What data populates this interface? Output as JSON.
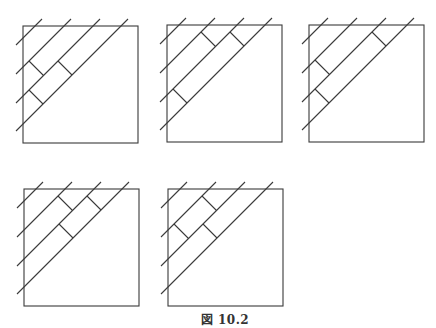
{
  "caption": "図 10.2",
  "style": {
    "stroke": "#3a3a3a",
    "background": "#ffffff"
  },
  "square": {
    "width": 115,
    "height": 117
  },
  "diagonals": {
    "offsets": [
      12,
      41,
      70,
      98
    ],
    "overhang": 7
  },
  "rung_bands": {
    "band_1_2": {
      "from_line": 1,
      "to_line": 2
    },
    "band_2_3": {
      "from_line": 2,
      "to_line": 3
    }
  },
  "figures": [
    {
      "id": "fig-1",
      "x": 23,
      "y": 26,
      "rungs": [
        {
          "band": "band_1_2",
          "d": -29
        },
        {
          "band": "band_2_3",
          "d": 0
        },
        {
          "band": "band_2_3",
          "d": -58
        }
      ]
    },
    {
      "id": "fig-2",
      "x": 167,
      "y": 25,
      "rungs": [
        {
          "band": "band_1_2",
          "d": 27
        },
        {
          "band": "band_2_3",
          "d": 56
        },
        {
          "band": "band_2_3",
          "d": -58
        }
      ]
    },
    {
      "id": "fig-3",
      "x": 309,
      "y": 25,
      "rungs": [
        {
          "band": "band_1_2",
          "d": -29
        },
        {
          "band": "band_2_3",
          "d": 56
        },
        {
          "band": "band_2_3",
          "d": -58
        }
      ]
    },
    {
      "id": "fig-4",
      "x": 24,
      "y": 189,
      "rungs": [
        {
          "band": "band_1_2",
          "d": 27
        },
        {
          "band": "band_2_3",
          "d": 56
        },
        {
          "band": "band_2_3",
          "d": 0
        }
      ]
    },
    {
      "id": "fig-5",
      "x": 168,
      "y": 189,
      "rungs": [
        {
          "band": "band_1_2",
          "d": 27
        },
        {
          "band": "band_1_2",
          "d": -29
        },
        {
          "band": "band_2_3",
          "d": 0
        }
      ]
    }
  ]
}
